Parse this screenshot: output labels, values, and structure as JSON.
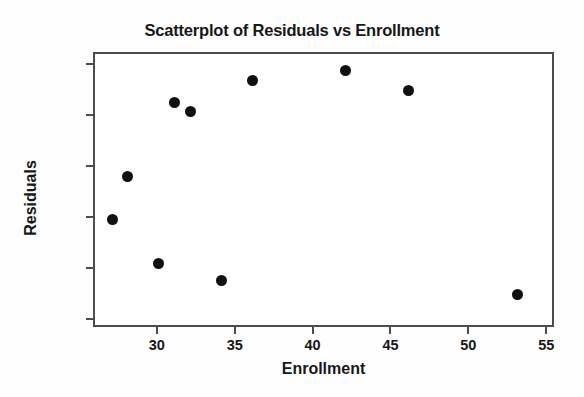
{
  "chart_data": {
    "type": "scatter",
    "title": "Scatterplot of Residuals vs Enrollment",
    "xlabel": "Enrollment",
    "ylabel": "Residuals",
    "xlim": [
      25.9,
      55.5
    ],
    "ylim": [
      -79,
      56
    ],
    "grid": false,
    "legend": null,
    "xticks": [
      30,
      35,
      40,
      45,
      50,
      55
    ],
    "xtick_labels": [
      "30",
      "35",
      "40",
      "45",
      "50",
      "55"
    ],
    "yticks": [
      50,
      25,
      0,
      -25,
      -50,
      -75
    ],
    "ytick_labels": [
      "50",
      "25",
      "0",
      "-25",
      "-50",
      "-75"
    ],
    "marker": {
      "shape": "circle",
      "color": "#101010",
      "size_px": 11
    },
    "points": [
      {
        "x": 27,
        "y": -25
      },
      {
        "x": 28,
        "y": -4
      },
      {
        "x": 30,
        "y": -47
      },
      {
        "x": 31,
        "y": 32
      },
      {
        "x": 32,
        "y": 28
      },
      {
        "x": 34,
        "y": -55
      },
      {
        "x": 36,
        "y": 43
      },
      {
        "x": 42,
        "y": 48
      },
      {
        "x": 46,
        "y": 38
      },
      {
        "x": 53,
        "y": -62
      }
    ]
  },
  "style": {
    "frame_color": "#4c4c4c",
    "text_color": "#171717",
    "background": "#ffffff"
  }
}
